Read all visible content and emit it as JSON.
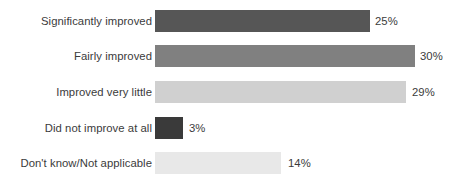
{
  "chart_data": {
    "type": "bar",
    "orientation": "horizontal",
    "title": "",
    "subtitle": "",
    "xlabel": "",
    "ylabel": "",
    "grid": false,
    "legend": false,
    "axis_visible": false,
    "xlim": [
      0,
      34
    ],
    "categories": [
      "Significantly improved",
      "Fairly improved",
      "Improved very little",
      "Did not improve at all",
      "Don't know/Not applicable"
    ],
    "values": [
      25,
      30,
      29,
      3,
      14
    ],
    "value_labels": [
      "25%",
      "30%",
      "29%",
      "3%",
      "14%"
    ],
    "bar_colors": [
      "#565656",
      "#808080",
      "#d0d0d0",
      "#3a3a3a",
      "#e8e8e8"
    ],
    "bars": [
      {
        "category": "Significantly improved",
        "value": 25,
        "value_label": "25%",
        "color": "#565656",
        "pixel_width": "215px",
        "pixel_top": "10px",
        "label_left": "375px"
      },
      {
        "category": "Fairly improved",
        "value": 30,
        "value_label": "30%",
        "color": "#808080",
        "pixel_width": "260px",
        "pixel_top": "45px",
        "label_left": "420px"
      },
      {
        "category": "Improved very little",
        "value": 29,
        "value_label": "29%",
        "color": "#d0d0d0",
        "pixel_width": "251px",
        "pixel_top": "81px",
        "label_left": "412px"
      },
      {
        "category": "Did not improve at all",
        "value": 3,
        "value_label": "3%",
        "color": "#3a3a3a",
        "pixel_width": "28px",
        "pixel_top": "117px",
        "label_left": "189px"
      },
      {
        "category": "Don't know/Not applicable",
        "value": 14,
        "value_label": "14%",
        "color": "#e8e8e8",
        "pixel_width": "126px",
        "pixel_top": "152px",
        "label_left": "288px"
      }
    ],
    "background_color": "#ffffff",
    "text_color": "#3b3b3b"
  }
}
